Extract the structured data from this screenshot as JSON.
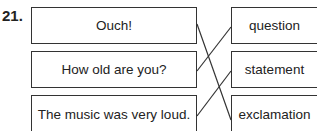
{
  "question_number": "21.",
  "left_items": [
    "Ouch!",
    "How old are you?",
    "The music was very loud."
  ],
  "right_items": [
    "question",
    "statement",
    "exclamation"
  ],
  "connections": [
    {
      "from": "Ouch!",
      "to": "exclamation"
    },
    {
      "from": "How old are you?",
      "to": "question"
    },
    {
      "from": "The music was very loud.",
      "to": "statement"
    }
  ],
  "colors": {
    "line": "#333333",
    "border": "#333333"
  }
}
